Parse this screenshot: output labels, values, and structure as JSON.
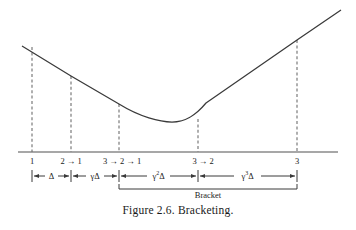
{
  "figure": {
    "caption": "Figure 2.6.  Bracketing.",
    "bracket_label": "Bracket",
    "colors": {
      "curve": "#3a3a3a",
      "axis": "#8a8a8a",
      "dashed": "#6e6e6e",
      "dimension": "#3a3a3a",
      "text": "#1a1a1a",
      "background": "#ffffff"
    }
  },
  "axis": {
    "x_start": 18,
    "x_end": 338,
    "y": 152
  },
  "tick_labels": [
    {
      "id": "tick-1",
      "text": "1",
      "x": 32
    },
    {
      "id": "tick-2",
      "text": "2 → 1",
      "x": 71
    },
    {
      "id": "tick-3",
      "text": "3 → 2 → 1",
      "x": 122
    },
    {
      "id": "tick-4",
      "text": "3 → 2",
      "x": 203
    },
    {
      "id": "tick-5",
      "text": "3",
      "x": 297
    }
  ],
  "dimensions": [
    {
      "id": "dim-delta",
      "base": "Γ",
      "label_plain": "Δ",
      "exp": "",
      "x0": 32,
      "x1": 71,
      "center": 51.5
    },
    {
      "id": "dim-gamma-delta",
      "base": "γ",
      "label_plain": "γΔ",
      "exp": "",
      "x0": 71,
      "x1": 119,
      "center": 95
    },
    {
      "id": "dim-gamma2-delta",
      "base": "γ",
      "label_plain": "γΔ",
      "exp": "2",
      "x0": 119,
      "x1": 198,
      "center": 158.5
    },
    {
      "id": "dim-gamma3-delta",
      "base": "γ",
      "label_plain": "γΔ",
      "exp": "3",
      "x0": 198,
      "x1": 297,
      "center": 247.5
    }
  ],
  "bracket": {
    "x0": 119,
    "x1": 297,
    "y": 189,
    "label_x": 208,
    "label_y": 192
  },
  "dashed_lines": [
    {
      "id": "dash-1",
      "x": 32,
      "y_top": 47,
      "y_bottom": 152
    },
    {
      "id": "dash-2",
      "x": 71,
      "y_top": 76,
      "y_bottom": 152
    },
    {
      "id": "dash-3",
      "x": 119,
      "y_top": 104,
      "y_bottom": 152
    },
    {
      "id": "dash-4",
      "x": 198,
      "y_top": 119,
      "y_bottom": 152
    },
    {
      "id": "dash-5",
      "x": 297,
      "y_top": 40,
      "y_bottom": 152
    }
  ],
  "curve": {
    "description": "unimodal objective function with a single minimum near x=172",
    "path": "M 22,46 L 71,76 L 119,104 C 140,117 160,122 172,122 C 186,122 196,115 206,103 L 297,40 L 341,10",
    "minimum": {
      "x": 172,
      "y": 122
    }
  },
  "caption_position": {
    "x": 178,
    "y": 208
  }
}
